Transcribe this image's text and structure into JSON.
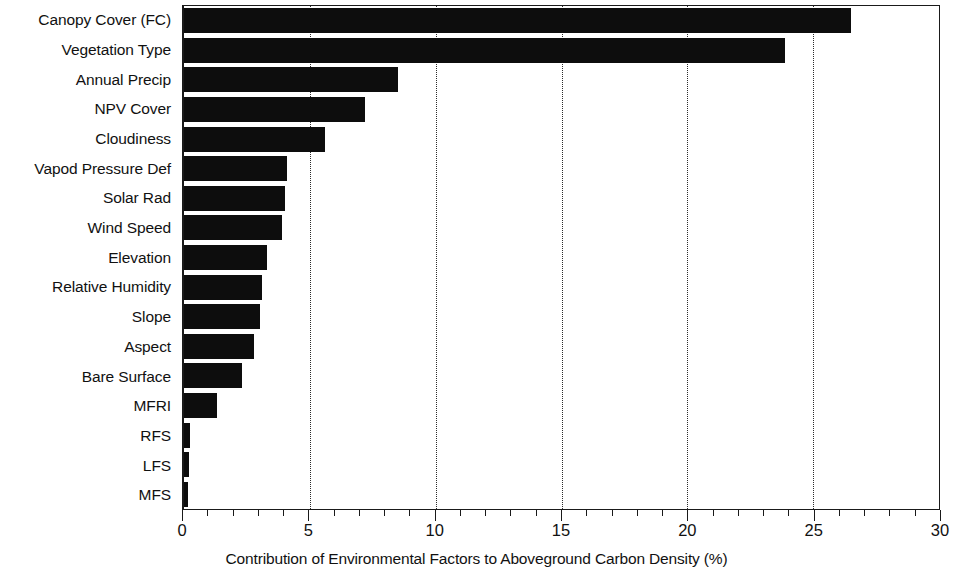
{
  "chart_data": {
    "type": "bar",
    "orientation": "horizontal",
    "title": "",
    "xlabel": "Contribution of Environmental Factors to Aboveground Carbon Density (%)",
    "ylabel": "",
    "xlim": [
      0,
      30
    ],
    "ylim": null,
    "grid": "vertical dotted gridlines at major x ticks",
    "legend": null,
    "x_major_ticks": [
      0,
      5,
      10,
      15,
      20,
      25,
      30
    ],
    "x_minor_tick_step": 1,
    "x_tick_labels": [
      "0",
      "5",
      "10",
      "15",
      "20",
      "25",
      "30"
    ],
    "categories": [
      "Canopy Cover (FC)",
      "Vegetation Type",
      "Annual Precip",
      "NPV Cover",
      "Cloudiness",
      "Vapod Pressure Def",
      "Solar Rad",
      "Wind Speed",
      "Elevation",
      "Relative Humidity",
      "Slope",
      "Aspect",
      "Bare Surface",
      "MFRI",
      "RFS",
      "LFS",
      "MFS"
    ],
    "values": [
      26.5,
      23.9,
      8.5,
      7.2,
      5.6,
      4.1,
      4.0,
      3.9,
      3.3,
      3.1,
      3.0,
      2.8,
      2.3,
      1.3,
      0.25,
      0.2,
      0.15
    ],
    "bar_color": "#0d0d0d",
    "axis_color": "#1a1a1a",
    "background_color": "#ffffff"
  }
}
